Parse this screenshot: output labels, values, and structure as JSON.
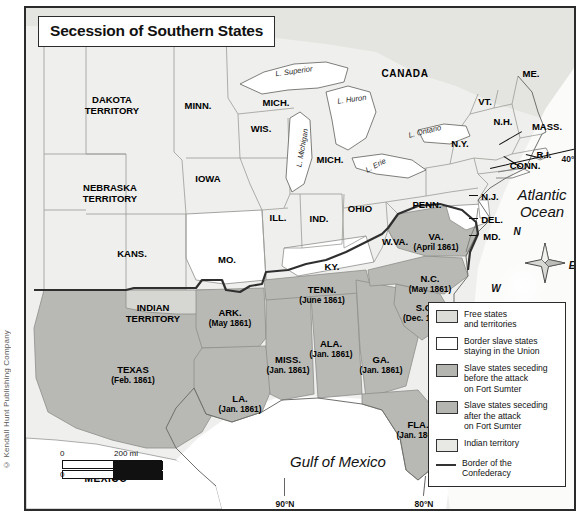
{
  "meta": {
    "copyright": "© Kendall Hunt Publishing Company"
  },
  "title": "Secession of Southern States",
  "colors": {
    "free_states": "#dcdcd8",
    "border_slave": "#ffffff",
    "seceded_before": "#b4b4b0",
    "seceded_after": "#b4b4b0",
    "indian_territory": "#e8e8e4",
    "water": "#ffffff",
    "confederacy_border": "#333333",
    "frame": "#2b2b2b"
  },
  "labels": {
    "countries": [
      {
        "name": "CANADA",
        "text": "CANADA",
        "x": 379,
        "y": 66
      },
      {
        "name": "MEXICO",
        "text": "MEXICO",
        "x": 80,
        "y": 471
      }
    ],
    "water_bodies": [
      {
        "name": "lake-superior",
        "text": "L. Superior",
        "x": 268,
        "y": 64,
        "rot": -8
      },
      {
        "name": "lake-huron",
        "text": "L. Huron",
        "x": 326,
        "y": 92,
        "rot": -8
      },
      {
        "name": "lake-michigan",
        "text": "L. Michigan",
        "x": 277,
        "y": 140,
        "rot": -80
      },
      {
        "name": "lake-ontario",
        "text": "L. Ontario",
        "x": 399,
        "y": 124,
        "rot": -14
      },
      {
        "name": "lake-erie",
        "text": "L. Erie",
        "x": 350,
        "y": 158,
        "rot": -28
      },
      {
        "name": "atlantic-ocean",
        "text": "Atlantic\nOcean",
        "x": 516,
        "y": 196
      },
      {
        "name": "gulf-of-mexico",
        "text": "Gulf of Mexico",
        "x": 312,
        "y": 454
      }
    ],
    "territories": [
      {
        "name": "dakota-territory",
        "text": "DAKOTA\nTERRITORY",
        "x": 86,
        "y": 98
      },
      {
        "name": "nebraska-territory",
        "text": "NEBRASKA\nTERRITORY",
        "x": 84,
        "y": 186
      },
      {
        "name": "indian-territory",
        "text": "INDIAN\nTERRITORY",
        "x": 127,
        "y": 306
      }
    ],
    "free_states": [
      {
        "name": "state-minnesota",
        "text": "MINN.",
        "x": 172,
        "y": 98
      },
      {
        "name": "state-wisconsin",
        "text": "WIS.",
        "x": 235,
        "y": 121
      },
      {
        "name": "state-michigan-up",
        "text": "MICH.",
        "x": 250,
        "y": 95
      },
      {
        "name": "state-michigan",
        "text": "MICH.",
        "x": 304,
        "y": 152
      },
      {
        "name": "state-iowa",
        "text": "IOWA",
        "x": 182,
        "y": 171
      },
      {
        "name": "state-illinois",
        "text": "ILL.",
        "x": 252,
        "y": 210
      },
      {
        "name": "state-indiana",
        "text": "IND.",
        "x": 293,
        "y": 211
      },
      {
        "name": "state-ohio",
        "text": "OHIO",
        "x": 334,
        "y": 201
      },
      {
        "name": "state-kansas",
        "text": "KANS.",
        "x": 106,
        "y": 246
      },
      {
        "name": "state-pennsylvania",
        "text": "PENN.",
        "x": 401,
        "y": 197
      },
      {
        "name": "state-new-york",
        "text": "N.Y.",
        "x": 434,
        "y": 136
      },
      {
        "name": "state-vermont",
        "text": "VT.",
        "x": 459,
        "y": 94
      },
      {
        "name": "state-new-hampshire",
        "text": "N.H.",
        "x": 477,
        "y": 114
      },
      {
        "name": "state-maine",
        "text": "ME.",
        "x": 505,
        "y": 66
      },
      {
        "name": "state-massachusetts",
        "text": "MASS.",
        "x": 521,
        "y": 119
      },
      {
        "name": "state-rhode-island",
        "text": "R.I.",
        "x": 518,
        "y": 147
      },
      {
        "name": "state-connecticut",
        "text": "CONN.",
        "x": 499,
        "y": 158
      },
      {
        "name": "state-new-jersey",
        "text": "N.J.",
        "x": 464,
        "y": 189
      },
      {
        "name": "state-west-virginia",
        "text": "W.VA.",
        "x": 369,
        "y": 234
      }
    ],
    "border_slave_states": [
      {
        "name": "state-missouri",
        "text": "MO.",
        "x": 201,
        "y": 252
      },
      {
        "name": "state-kentucky",
        "text": "KY.",
        "x": 306,
        "y": 259
      },
      {
        "name": "state-delaware",
        "text": "DEL.",
        "x": 466,
        "y": 212
      },
      {
        "name": "state-maryland",
        "text": "MD.",
        "x": 466,
        "y": 229
      }
    ],
    "seceded_states": [
      {
        "name": "state-south-carolina",
        "text": "S.C.",
        "date": "(Dec. 1860)",
        "x": 399,
        "y": 305
      },
      {
        "name": "state-mississippi",
        "text": "MISS.",
        "date": "(Jan. 1861)",
        "x": 262,
        "y": 357
      },
      {
        "name": "state-florida",
        "text": "FLA.",
        "date": "(Jan. 1861)",
        "x": 392,
        "y": 422
      },
      {
        "name": "state-alabama",
        "text": "ALA.",
        "date": "(Jan. 1861)",
        "x": 305,
        "y": 341
      },
      {
        "name": "state-georgia",
        "text": "GA.",
        "date": "(Jan. 1861)",
        "x": 355,
        "y": 357
      },
      {
        "name": "state-louisiana",
        "text": "LA.",
        "date": "(Jan. 1861)",
        "x": 214,
        "y": 396
      },
      {
        "name": "state-texas",
        "text": "TEXAS",
        "date": "(Feb. 1861)",
        "x": 107,
        "y": 367
      },
      {
        "name": "state-virginia",
        "text": "VA.",
        "date": "(April 1861)",
        "x": 410,
        "y": 234
      },
      {
        "name": "state-arkansas",
        "text": "ARK.",
        "date": "(May 1861)",
        "x": 204,
        "y": 310
      },
      {
        "name": "state-north-carolina",
        "text": "N.C.",
        "date": "(May 1861)",
        "x": 404,
        "y": 276
      },
      {
        "name": "state-tennessee",
        "text": "TENN.",
        "date": "(June 1861)",
        "x": 296,
        "y": 287
      }
    ],
    "coordinates": [
      {
        "name": "coord-40n",
        "text": "40°N",
        "x": 545,
        "y": 152
      },
      {
        "name": "coord-90n",
        "text": "90°N",
        "x": 259,
        "y": 497
      },
      {
        "name": "coord-80n",
        "text": "80°N",
        "x": 398,
        "y": 497
      }
    ]
  },
  "compass": {
    "north": "N",
    "east": "E",
    "south": "S",
    "west": "W"
  },
  "legend": {
    "items": [
      {
        "name": "legend-free-states",
        "swatch": "#dcdcd8",
        "type": "box",
        "text": "Free states\nand territories"
      },
      {
        "name": "legend-border-slave-states",
        "swatch": "#ffffff",
        "type": "box",
        "text": "Border slave states\nstaying in the Union"
      },
      {
        "name": "legend-seceded-before-sumter",
        "swatch": "#b4b4b0",
        "type": "box",
        "text": "Slave states seceding\nbefore the attack\non Fort Sumter"
      },
      {
        "name": "legend-seceded-after-sumter",
        "swatch": "#b4b4b0",
        "type": "box",
        "text": "Slave states seceding\nafter the attack\non Fort Sumter"
      },
      {
        "name": "legend-indian-territory",
        "swatch": "#e8e8e4",
        "type": "box",
        "text": "Indian territory"
      },
      {
        "name": "legend-confederacy-border",
        "swatch": "#333333",
        "type": "line",
        "text": "Border of the\nConfederacy"
      }
    ]
  },
  "scale": {
    "miles_zero": "0",
    "miles": "200 mi",
    "km_zero": "0",
    "km": "300 km"
  }
}
